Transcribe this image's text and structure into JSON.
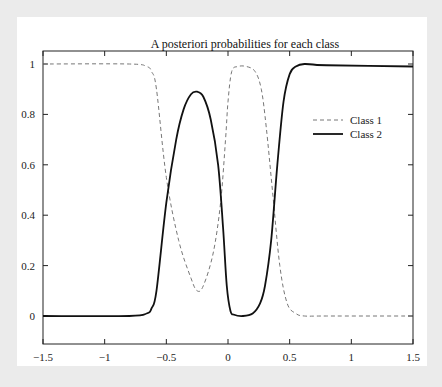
{
  "chart_data": {
    "type": "line",
    "title": "A posteriori probabilities for each class",
    "xlabel": "",
    "ylabel": "",
    "xlim": [
      -1.5,
      1.5
    ],
    "ylim": [
      -0.11,
      1.05
    ],
    "xticks": [
      -1.5,
      -1,
      -0.5,
      0,
      0.5,
      1,
      1.5
    ],
    "xtick_labels": [
      "−1.5",
      "−1",
      "−0.5",
      "0",
      "0.5",
      "1",
      "1.5"
    ],
    "yticks": [
      0,
      0.2,
      0.4,
      0.6,
      0.8,
      1
    ],
    "ytick_labels": [
      "0",
      "0.2",
      "0.4",
      "0.6",
      "0.8",
      "1"
    ],
    "grid": false,
    "legend_position": "upper right (inside)",
    "series": [
      {
        "name": "Class 1",
        "style": "dashed",
        "color": "#777777",
        "x": [
          -1.5,
          -0.8,
          -0.66,
          -0.62,
          -0.58,
          -0.5,
          -0.4,
          -0.3,
          -0.25,
          -0.2,
          -0.12,
          -0.06,
          -0.02,
          0.0,
          0.03,
          0.08,
          0.15,
          0.22,
          0.27,
          0.31,
          0.36,
          0.42,
          0.48,
          0.55,
          0.62,
          0.8,
          1.5
        ],
        "y": [
          1.0,
          1.0,
          0.99,
          0.97,
          0.9,
          0.55,
          0.3,
          0.15,
          0.1,
          0.12,
          0.25,
          0.45,
          0.7,
          0.85,
          0.97,
          0.99,
          0.99,
          0.97,
          0.9,
          0.75,
          0.5,
          0.2,
          0.05,
          0.01,
          0.0,
          0.0,
          0.0
        ]
      },
      {
        "name": "Class 2",
        "style": "solid",
        "color": "#111111",
        "x": [
          -1.5,
          -0.8,
          -0.66,
          -0.62,
          -0.58,
          -0.5,
          -0.42,
          -0.36,
          -0.3,
          -0.25,
          -0.2,
          -0.14,
          -0.08,
          -0.04,
          -0.01,
          0.02,
          0.05,
          0.12,
          0.2,
          0.26,
          0.3,
          0.35,
          0.4,
          0.45,
          0.5,
          0.55,
          0.62,
          0.8,
          1.5
        ],
        "y": [
          0.0,
          0.0,
          0.01,
          0.03,
          0.1,
          0.45,
          0.7,
          0.82,
          0.88,
          0.89,
          0.87,
          0.78,
          0.6,
          0.35,
          0.12,
          0.02,
          0.005,
          0.0,
          0.01,
          0.05,
          0.12,
          0.3,
          0.6,
          0.85,
          0.96,
          0.99,
          1.0,
          0.995,
          0.99
        ]
      }
    ]
  }
}
